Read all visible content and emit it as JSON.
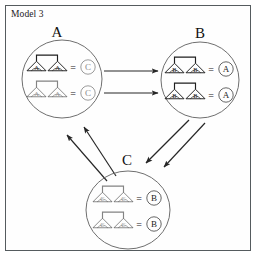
{
  "figure": {
    "caption": "Model 3",
    "border_color": "#555b5e",
    "background": "#ffffff"
  },
  "clusters": [
    {
      "id": "A",
      "label": "A",
      "label_x": 57,
      "label_y": 24,
      "cx": 62,
      "cy": 79,
      "rx": 40,
      "ry": 39,
      "stroke": "#6f6f6f",
      "rows": [
        {
          "tree_left_letter": "A",
          "tree_right_letter": "A",
          "equals": "=",
          "result": "C",
          "result_faint": true,
          "tree_faint": false,
          "y": 66
        },
        {
          "tree_left_letter": "A",
          "tree_right_letter": "A",
          "equals": "=",
          "result": "C",
          "result_faint": true,
          "tree_faint": true,
          "y": 92
        }
      ]
    },
    {
      "id": "B",
      "label": "B",
      "label_x": 200,
      "label_y": 25,
      "cx": 200,
      "cy": 80,
      "rx": 39,
      "ry": 38,
      "stroke": "#6f6f6f",
      "rows": [
        {
          "tree_left_letter": "B",
          "tree_right_letter": "B",
          "equals": "=",
          "result": "A",
          "result_faint": false,
          "tree_faint": false,
          "y": 68
        },
        {
          "tree_left_letter": "B",
          "tree_right_letter": "B",
          "equals": "=",
          "result": "A",
          "result_faint": false,
          "tree_faint": false,
          "y": 94
        }
      ]
    },
    {
      "id": "C",
      "label": "C",
      "label_x": 127,
      "label_y": 152,
      "cx": 128,
      "cy": 210,
      "rx": 42,
      "ry": 39,
      "stroke": "#6f6f6f",
      "rows": [
        {
          "tree_left_letter": "C",
          "tree_right_letter": "C",
          "equals": "=",
          "result": "B",
          "result_faint": false,
          "tree_faint": true,
          "y": 197
        },
        {
          "tree_left_letter": "C",
          "tree_right_letter": "C",
          "equals": "=",
          "result": "B",
          "result_faint": false,
          "tree_faint": true,
          "y": 223
        }
      ]
    }
  ],
  "arrows": [
    {
      "name": "a-to-b-upper",
      "from": "A",
      "to": "B",
      "x1": 104,
      "y1": 71,
      "x2": 158,
      "y2": 71
    },
    {
      "name": "a-to-b-lower",
      "from": "A",
      "to": "B",
      "x1": 104,
      "y1": 93,
      "x2": 158,
      "y2": 93
    },
    {
      "name": "b-to-c-outer",
      "from": "B",
      "to": "C",
      "x1": 189,
      "y1": 120,
      "x2": 146,
      "y2": 163
    },
    {
      "name": "b-to-c-inner",
      "from": "B",
      "to": "C",
      "x1": 205,
      "y1": 123,
      "x2": 164,
      "y2": 167
    },
    {
      "name": "c-to-a-outer",
      "from": "C",
      "to": "A",
      "x1": 107,
      "y1": 181,
      "x2": 67,
      "y2": 135
    },
    {
      "name": "c-to-a-inner",
      "from": "C",
      "to": "A",
      "x1": 116,
      "y1": 176,
      "x2": 84,
      "y2": 127
    }
  ],
  "style": {
    "arrow_color": "#262626",
    "tree_color": "#1e1e1e",
    "circle_color": "#5e5e5e"
  }
}
